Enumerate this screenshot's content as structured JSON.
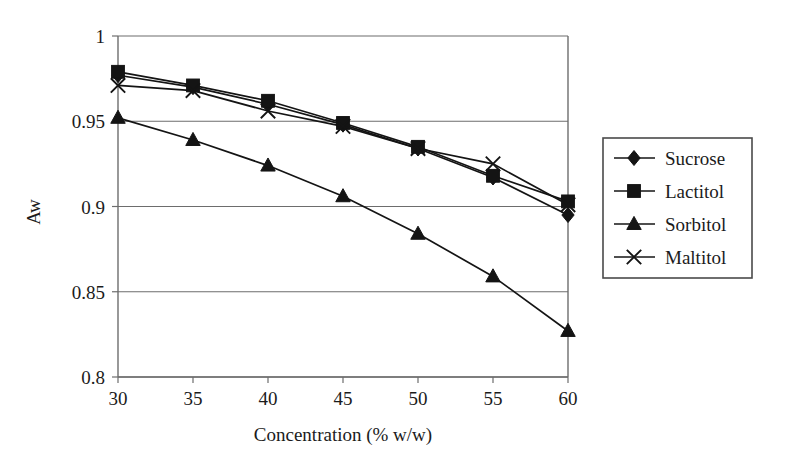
{
  "chart_data": {
    "type": "line",
    "title": "",
    "xlabel": "Concentration (% w/w)",
    "ylabel": "Aw",
    "x": [
      30,
      35,
      40,
      45,
      50,
      55,
      60
    ],
    "xlim": [
      30,
      60
    ],
    "ylim": [
      0.8,
      1.0
    ],
    "xticks": [
      "30",
      "35",
      "40",
      "45",
      "50",
      "55",
      "60"
    ],
    "yticks": [
      "1",
      "0.95",
      "0.9",
      "0.85",
      "0.8"
    ],
    "ytick_values": [
      1,
      0.95,
      0.9,
      0.85,
      0.8
    ],
    "grid": "horizontal",
    "legend_position": "right-outside",
    "series": [
      {
        "name": "Sucrose",
        "marker": "diamond",
        "values": [
          0.977,
          0.97,
          0.96,
          0.948,
          0.934,
          0.917,
          0.895
        ]
      },
      {
        "name": "Lactitol",
        "marker": "square",
        "values": [
          0.979,
          0.971,
          0.962,
          0.949,
          0.935,
          0.918,
          0.903
        ]
      },
      {
        "name": "Sorbitol",
        "marker": "triangle",
        "values": [
          0.952,
          0.939,
          0.924,
          0.906,
          0.884,
          0.859,
          0.827
        ]
      },
      {
        "name": "Maltitol",
        "marker": "cross",
        "values": [
          0.971,
          0.968,
          0.956,
          0.947,
          0.934,
          0.925,
          0.901
        ]
      }
    ]
  },
  "legend": {
    "entries": [
      {
        "label": "Sucrose",
        "marker": "diamond"
      },
      {
        "label": "Lactitol",
        "marker": "square"
      },
      {
        "label": "Sorbitol",
        "marker": "triangle"
      },
      {
        "label": "Maltitol",
        "marker": "cross"
      }
    ]
  },
  "colors": {
    "line": "#141414",
    "grid": "#6d6d6d",
    "frame": "#6d6d6d",
    "text": "#1b1b1b",
    "background": "#ffffff"
  }
}
